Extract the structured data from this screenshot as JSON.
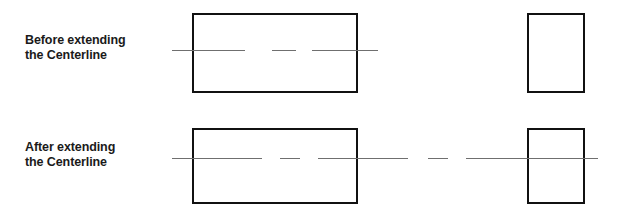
{
  "figure": {
    "background_color": "#ffffff",
    "width": 625,
    "height": 219
  },
  "style": {
    "outline_color": "#111111",
    "outline_width": 2.5,
    "centerline_color": "#6f6f6f",
    "centerline_width": 1.6,
    "label_color": "#1a1a1a"
  },
  "rows": [
    {
      "id": "before",
      "label": "Before extending\nthe Centerline",
      "label_line1": "Before extending",
      "label_line2": "the Centerline",
      "shapes": [
        {
          "name": "large-rectangle",
          "x": 192,
          "y": 13,
          "width": 166,
          "height": 80
        },
        {
          "name": "small-square",
          "x": 527,
          "y": 13,
          "width": 58,
          "height": 80
        }
      ],
      "centerline": {
        "y": 50,
        "description": "Centerline spans only the large rectangle and stops short of the small square",
        "segments": [
          {
            "x1": 172,
            "x2": 245
          },
          {
            "x1": 272,
            "x2": 296
          },
          {
            "x1": 312,
            "x2": 378
          }
        ]
      }
    },
    {
      "id": "after",
      "label": "After extending\nthe Centerline",
      "label_line1": "After extending",
      "label_line2": "the Centerline",
      "shapes": [
        {
          "name": "large-rectangle",
          "x": 192,
          "y": 128,
          "width": 166,
          "height": 76
        },
        {
          "name": "small-square",
          "x": 527,
          "y": 128,
          "width": 58,
          "height": 76
        }
      ],
      "centerline": {
        "y": 158,
        "description": "Centerline extended across the gap and through the small square",
        "segments": [
          {
            "x1": 172,
            "x2": 262
          },
          {
            "x1": 280,
            "x2": 300
          },
          {
            "x1": 318,
            "x2": 408
          },
          {
            "x1": 428,
            "x2": 448
          },
          {
            "x1": 466,
            "x2": 598
          }
        ]
      }
    }
  ],
  "labels": {
    "before_heading": "Before extending the Centerline",
    "after_heading": "After extending the Centerline"
  }
}
